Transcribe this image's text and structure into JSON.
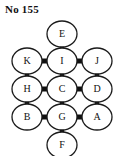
{
  "title": "No 155",
  "diagram": {
    "type": "graph",
    "node_shape": "ellipse",
    "edge_style": "thick-bar",
    "colors": {
      "background": "#ffffff",
      "node_fill": "#ffffff",
      "node_stroke": "#1a1a1a",
      "edge": "#101010",
      "text": "#111111"
    },
    "nodes": [
      {
        "id": "E",
        "label": "E",
        "cx": 62,
        "cy": 34,
        "rx": 15,
        "ry": 13
      },
      {
        "id": "K",
        "label": "K",
        "cx": 27,
        "cy": 61,
        "rx": 15,
        "ry": 13
      },
      {
        "id": "I",
        "label": "I",
        "cx": 62,
        "cy": 61,
        "rx": 15,
        "ry": 13
      },
      {
        "id": "J",
        "label": "J",
        "cx": 97,
        "cy": 61,
        "rx": 15,
        "ry": 13
      },
      {
        "id": "H",
        "label": "H",
        "cx": 27,
        "cy": 89,
        "rx": 15,
        "ry": 13
      },
      {
        "id": "C",
        "label": "C",
        "cx": 62,
        "cy": 89,
        "rx": 15,
        "ry": 13
      },
      {
        "id": "D",
        "label": "D",
        "cx": 97,
        "cy": 89,
        "rx": 15,
        "ry": 13
      },
      {
        "id": "B",
        "label": "B",
        "cx": 27,
        "cy": 117,
        "rx": 15,
        "ry": 13
      },
      {
        "id": "G",
        "label": "G",
        "cx": 62,
        "cy": 117,
        "rx": 15,
        "ry": 13
      },
      {
        "id": "A",
        "label": "A",
        "cx": 97,
        "cy": 117,
        "rx": 15,
        "ry": 13
      },
      {
        "id": "F",
        "label": "F",
        "cx": 62,
        "cy": 145,
        "rx": 15,
        "ry": 13
      }
    ],
    "edges": [
      {
        "from": "E",
        "to": "I",
        "orientation": "vertical"
      },
      {
        "from": "K",
        "to": "I",
        "orientation": "horizontal"
      },
      {
        "from": "I",
        "to": "J",
        "orientation": "horizontal"
      },
      {
        "from": "K",
        "to": "H",
        "orientation": "vertical"
      },
      {
        "from": "I",
        "to": "C",
        "orientation": "vertical"
      },
      {
        "from": "J",
        "to": "D",
        "orientation": "vertical"
      },
      {
        "from": "H",
        "to": "C",
        "orientation": "horizontal"
      },
      {
        "from": "C",
        "to": "D",
        "orientation": "horizontal"
      },
      {
        "from": "H",
        "to": "B",
        "orientation": "vertical"
      },
      {
        "from": "C",
        "to": "G",
        "orientation": "vertical"
      },
      {
        "from": "D",
        "to": "A",
        "orientation": "vertical"
      },
      {
        "from": "B",
        "to": "G",
        "orientation": "horizontal"
      },
      {
        "from": "G",
        "to": "A",
        "orientation": "horizontal"
      },
      {
        "from": "G",
        "to": "F",
        "orientation": "vertical"
      }
    ]
  }
}
